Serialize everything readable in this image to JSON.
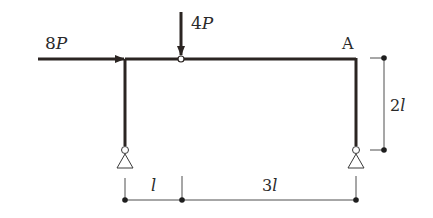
{
  "diagram": {
    "type": "portal frame",
    "loads": [
      {
        "label_num": "8",
        "label_var": "P",
        "direction": "right",
        "applied_at": "left column top"
      },
      {
        "label_num": "4",
        "label_var": "P",
        "direction": "down",
        "applied_at": "hinge"
      }
    ],
    "point_label": "A",
    "dimensions": {
      "height": {
        "num": "2",
        "var": "l"
      },
      "span_left": {
        "num": "",
        "var": "l"
      },
      "span_right": {
        "num": "3",
        "var": "l"
      }
    },
    "supports": [
      "pin-left",
      "pin-right"
    ],
    "colors": {
      "member": "#2b2522",
      "dim": "#3a3a3a",
      "background": "#ffffff"
    }
  }
}
